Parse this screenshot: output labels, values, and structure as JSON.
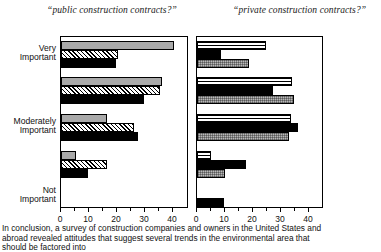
{
  "figure": {
    "caption_lines": [
      "In conclusion, a survey of construction companies and owners in the United States and",
      "abroad revealed attitudes that suggest several trends in the environmental area that",
      "should be factored into"
    ]
  },
  "category_labels": [
    "Very Important",
    "Moderately Important",
    "Not Important"
  ],
  "category_label_lines": {
    "very": [
      "Very",
      "Important"
    ],
    "moderately": [
      "Moderately",
      "Important"
    ],
    "not": [
      "Not",
      "Important"
    ]
  },
  "axis": {
    "ticks": [
      0,
      10,
      20,
      30,
      40
    ],
    "tick_labels": [
      "0",
      "10",
      "20",
      "30",
      "40"
    ],
    "min": 0,
    "max": 40
  },
  "colors": {
    "gray": "#a9a9a9",
    "black": "#000000",
    "dots": "#b8b8b8",
    "outline": "#000000",
    "background": "#ffffff"
  },
  "chart_data": [
    {
      "type": "bar",
      "orientation": "horizontal",
      "title": "“public construction contracts?”",
      "xlabel": "",
      "ylabel": "",
      "xlim": [
        0,
        40
      ],
      "grid": false,
      "legend": "none",
      "categories": [
        "Very Important",
        "",
        "Moderately Important",
        "",
        "Not Important"
      ],
      "series": [
        {
          "name": "gray",
          "pattern": "solid-gray",
          "values": [
            40.5,
            36.0,
            16.5,
            5.5,
            0
          ]
        },
        {
          "name": "hatched",
          "pattern": "diagonal-hatch",
          "values": [
            20.5,
            35.5,
            26.0,
            16.5,
            0
          ]
        },
        {
          "name": "black",
          "pattern": "solid-black",
          "values": [
            19.5,
            29.5,
            27.5,
            9.5,
            9.0
          ]
        }
      ]
    },
    {
      "type": "bar",
      "orientation": "horizontal",
      "title": "“private construction contracts?”",
      "xlabel": "",
      "ylabel": "",
      "xlim": [
        0,
        40
      ],
      "grid": false,
      "legend": "none",
      "categories": [
        "Very Important",
        "",
        "Moderately Important",
        "",
        "Not Important"
      ],
      "series": [
        {
          "name": "hlines",
          "pattern": "horizontal-lines",
          "values": [
            24.5,
            34.0,
            33.5,
            5.0,
            0
          ]
        },
        {
          "name": "black",
          "pattern": "solid-black",
          "values": [
            8.5,
            27.0,
            36.0,
            17.5,
            9.5
          ]
        },
        {
          "name": "dots",
          "pattern": "dotted-gray",
          "values": [
            18.5,
            34.5,
            33.0,
            10.0,
            0
          ]
        }
      ]
    }
  ]
}
